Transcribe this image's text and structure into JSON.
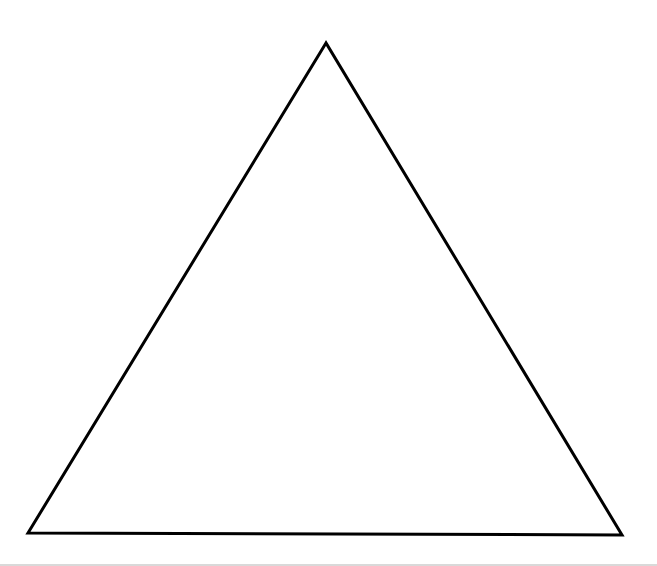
{
  "figure": {
    "shape": "triangle",
    "fill": "none",
    "stroke_color": "#000000",
    "stroke_width": 3,
    "vertices": {
      "apex": [
        326,
        43
      ],
      "bottom_left": [
        28,
        533
      ],
      "bottom_right": [
        622,
        535
      ]
    }
  },
  "colors": {
    "background": "#ffffff",
    "bottom_rule": "#d9d9d9"
  }
}
